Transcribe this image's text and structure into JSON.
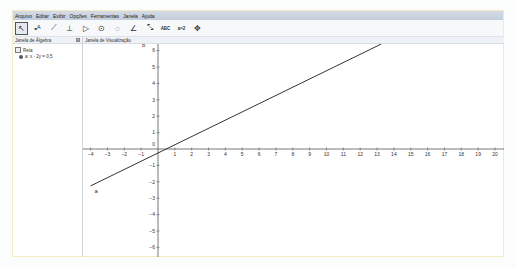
{
  "menu": [
    "Arquivo",
    "Editar",
    "Exibir",
    "Opções",
    "Ferramentas",
    "Janela",
    "Ajuda"
  ],
  "toolbar": {
    "tools": [
      {
        "name": "move-tool",
        "glyph": "↖",
        "active": true
      },
      {
        "name": "point-tool",
        "glyph": "•ᴬ"
      },
      {
        "name": "line-tool",
        "glyph": "⟋"
      },
      {
        "name": "perpendicular-tool",
        "glyph": "⊥"
      },
      {
        "name": "polygon-tool",
        "glyph": "▷"
      },
      {
        "name": "circle-tool",
        "glyph": "⊙"
      },
      {
        "name": "conic-tool",
        "glyph": "◌"
      },
      {
        "name": "angle-tool",
        "glyph": "∠"
      },
      {
        "name": "reflect-tool",
        "glyph": "⤡"
      },
      {
        "name": "text-tool",
        "glyph": "ABC"
      },
      {
        "name": "slider-tool",
        "glyph": "a=2"
      },
      {
        "name": "move-view-tool",
        "glyph": "✥"
      }
    ]
  },
  "algebra": {
    "title": "Janela de Álgebra",
    "category": "Reta",
    "items": [
      "a: x - 2y = 0,5"
    ]
  },
  "graphics": {
    "title": "Janela de Visualização",
    "x_ticks": [
      -4,
      -3,
      -2,
      -1,
      0,
      1,
      2,
      3,
      4,
      5,
      6,
      7,
      8,
      9,
      10,
      11,
      12,
      13,
      14,
      15,
      16,
      17,
      18,
      19,
      20
    ],
    "y_ticks": [
      -6,
      -5,
      -4,
      -3,
      -2,
      -1,
      0,
      1,
      2,
      3,
      4,
      5,
      6
    ],
    "line_label": "a",
    "axis_label_b": "b",
    "line": {
      "x1": -4,
      "y1": -2.25,
      "x2": 13.25,
      "y2": 6.4
    },
    "colors": {
      "line": "#333333",
      "axis": "#555555"
    }
  }
}
